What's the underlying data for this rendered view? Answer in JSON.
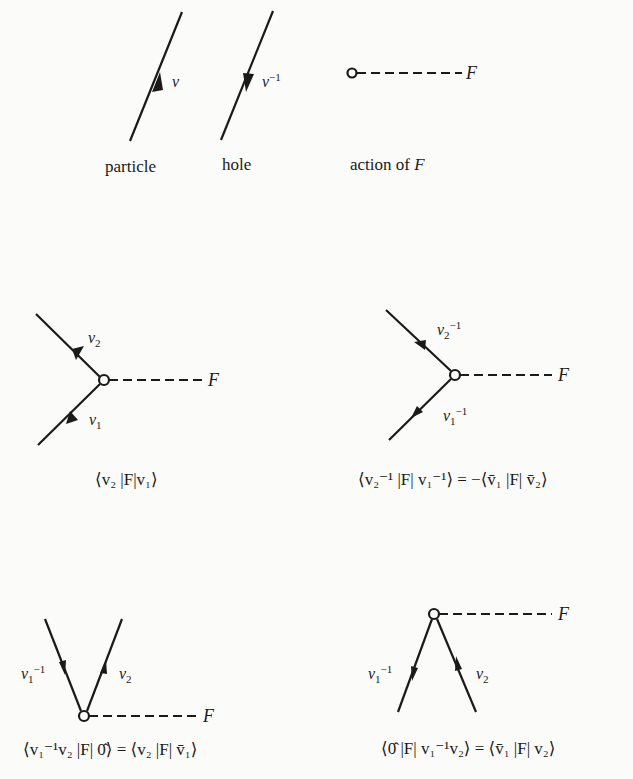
{
  "legend": {
    "particle": {
      "caption": "particle",
      "label": "v"
    },
    "hole": {
      "caption": "hole",
      "label": "v",
      "label_sup": "−1"
    },
    "action": {
      "caption_prefix": "action of ",
      "caption_var": "F",
      "label": "F"
    }
  },
  "diagrams": [
    {
      "id": "d1",
      "upper_label": "v",
      "upper_sub": "2",
      "upper_sup": "",
      "lower_label": "v",
      "lower_sub": "1",
      "lower_sup": "",
      "field_label": "F",
      "equation": "⟨v₂ |F|v₁⟩"
    },
    {
      "id": "d2",
      "upper_label": "v",
      "upper_sub": "2",
      "upper_sup": "−1",
      "lower_label": "v",
      "lower_sub": "1",
      "lower_sup": "−1",
      "field_label": "F",
      "equation": "⟨v₂⁻¹ |F| v₁⁻¹⟩ = −⟨v̄₁ |F| v̄₂⟩"
    },
    {
      "id": "d3",
      "left_label": "v",
      "left_sub": "1",
      "left_sup": "−1",
      "right_label": "v",
      "right_sub": "2",
      "field_label": "F",
      "equation": "⟨v₁⁻¹v₂ |F| 0̂⟩ = ⟨v₂ |F| v̄₁⟩"
    },
    {
      "id": "d4",
      "left_label": "v",
      "left_sub": "1",
      "left_sup": "−1",
      "right_label": "v",
      "right_sub": "2",
      "field_label": "F",
      "equation": "⟨0̂ |F| v₁⁻¹v₂⟩ = ⟨v̄₁ |F| v₂⟩"
    }
  ],
  "colors": {
    "ink": "#1a1a1a",
    "paper": "#fbfbf9"
  }
}
